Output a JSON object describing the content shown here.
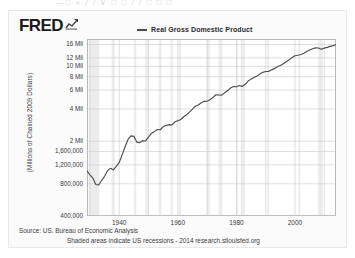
{
  "top_strip": {
    "ghost_text": "—□ ×   / /  ∨ □ □    / /  □ □ □"
  },
  "header": {
    "logo_text": "FRED",
    "logo_mark_icon": "mini-line-chart-icon",
    "legend": {
      "swatch_color": "#4d4d4d",
      "label": "Real Gross Domestic Product"
    }
  },
  "axes": {
    "y_axis_title": "(Millions of Chained 2009 Dollars)",
    "y_tick_labels": [
      "16 Mil",
      "12 Mil",
      "10 Mil",
      "8 Mil",
      "6 Mil",
      "4 Mil",
      "2 Mil",
      "1,600,000",
      "1,200,000",
      "800,000",
      "400,000"
    ],
    "x_tick_labels": [
      "1940",
      "1960",
      "1980",
      "2000"
    ]
  },
  "footer": {
    "source": "Source: US. Bureau of Economic Analysis",
    "note": "Shaded areas indicate US recessions - 2014 research.stlouisfed.org"
  },
  "chart_data": {
    "type": "line",
    "title": "Real Gross Domestic Product",
    "xlabel": "",
    "ylabel": "(Millions of Chained 2009 Dollars)",
    "y_scale": "log",
    "ylim": [
      400000,
      18000000
    ],
    "xlim": [
      1929,
      2014
    ],
    "grid": true,
    "legend_position": "top-center",
    "y_ticks": [
      400000,
      800000,
      1200000,
      1600000,
      2000000,
      4000000,
      6000000,
      8000000,
      10000000,
      12000000,
      16000000
    ],
    "y_tick_labels": [
      "400,000",
      "800,000",
      "1,200,000",
      "1,600,000",
      "2 Mil",
      "4 Mil",
      "6 Mil",
      "8 Mil",
      "10 Mil",
      "12 Mil",
      "16 Mil"
    ],
    "x_ticks": [
      1940,
      1960,
      1980,
      2000
    ],
    "series": [
      {
        "name": "Real Gross Domestic Product",
        "color": "#4d4d4d",
        "x": [
          1929,
          1930,
          1931,
          1932,
          1933,
          1934,
          1935,
          1936,
          1937,
          1938,
          1939,
          1940,
          1941,
          1942,
          1943,
          1944,
          1945,
          1946,
          1947,
          1948,
          1949,
          1950,
          1951,
          1952,
          1953,
          1954,
          1955,
          1956,
          1957,
          1958,
          1959,
          1960,
          1961,
          1962,
          1963,
          1964,
          1965,
          1966,
          1967,
          1968,
          1969,
          1970,
          1971,
          1972,
          1973,
          1974,
          1975,
          1976,
          1977,
          1978,
          1979,
          1980,
          1981,
          1982,
          1983,
          1984,
          1985,
          1986,
          1987,
          1988,
          1989,
          1990,
          1991,
          1992,
          1993,
          1994,
          1995,
          1996,
          1997,
          1998,
          1999,
          2000,
          2001,
          2002,
          2003,
          2004,
          2005,
          2006,
          2007,
          2008,
          2009,
          2010,
          2011,
          2012,
          2013,
          2014
        ],
        "values": [
          1056600,
          966700,
          904800,
          788200,
          778300,
          862200,
          939000,
          1060700,
          1114600,
          1076700,
          1163100,
          1266100,
          1490300,
          1771800,
          2073700,
          2239400,
          2217800,
          1960900,
          1939400,
          2020000,
          2008900,
          2184000,
          2360000,
          2456100,
          2571400,
          2556000,
          2739000,
          2797400,
          2856300,
          2835300,
          3031000,
          3108700,
          3188100,
          3383100,
          3530400,
          3734000,
          3976700,
          4238900,
          4355200,
          4569000,
          4712500,
          4722000,
          4877600,
          5134500,
          5424100,
          5396000,
          5385400,
          5675400,
          5937000,
          6267200,
          6466200,
          6450400,
          6617700,
          6491300,
          6792000,
          7285000,
          7593800,
          7860500,
          8132600,
          8474500,
          8786400,
          8955000,
          8948400,
          9266600,
          9521000,
          9905400,
          10174800,
          10561000,
          11034900,
          11525900,
          12065900,
          12559700,
          12682200,
          12908800,
          13271100,
          13773500,
          14234200,
          14613800,
          14873700,
          14830400,
          14418700,
          14783800,
          15020600,
          15354600,
          15612200,
          15900000
        ]
      }
    ],
    "recession_bands": [
      [
        1929.6,
        1933.2
      ],
      [
        1937.4,
        1938.5
      ],
      [
        1945.1,
        1945.8
      ],
      [
        1948.9,
        1949.8
      ],
      [
        1953.5,
        1954.4
      ],
      [
        1957.6,
        1958.3
      ],
      [
        1960.3,
        1961.1
      ],
      [
        1969.9,
        1970.9
      ],
      [
        1973.9,
        1975.2
      ],
      [
        1980.0,
        1980.5
      ],
      [
        1981.5,
        1982.9
      ],
      [
        1990.5,
        1991.2
      ],
      [
        2001.2,
        2001.8
      ],
      [
        2007.9,
        2009.5
      ]
    ]
  }
}
